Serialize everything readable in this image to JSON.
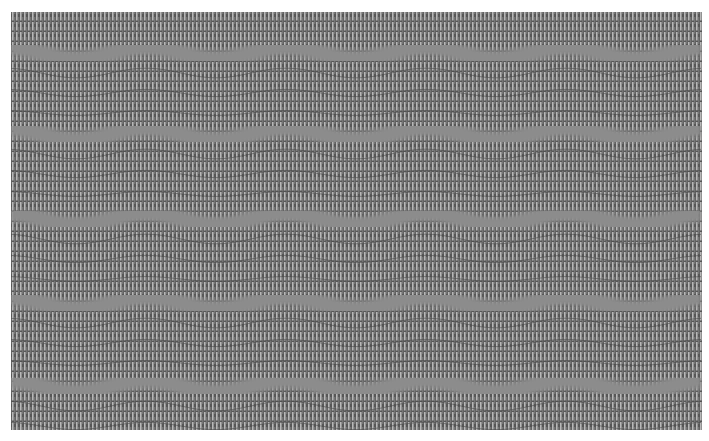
{
  "image": {
    "description": "Grayscale op-art pattern of fine vertical light stripes on dark gray, crossed by five horizontal wavy gray bands",
    "colors": {
      "background": "#575757",
      "stripe": "#b8b8b8",
      "band": "#8c8c8c",
      "page": "#ffffff"
    },
    "bounds": {
      "x": 11,
      "y": 12,
      "width": 691,
      "height": 418
    },
    "stripe_pitch_px": 4,
    "bands": [
      {
        "center_y": 41,
        "amplitude": 6
      },
      {
        "center_y": 122,
        "amplitude": 6
      },
      {
        "center_y": 207,
        "amplitude": 6
      },
      {
        "center_y": 291,
        "amplitude": 6
      },
      {
        "center_y": 374,
        "amplitude": 6
      }
    ],
    "wave_period_px": 140,
    "band_thickness_px": 16
  }
}
